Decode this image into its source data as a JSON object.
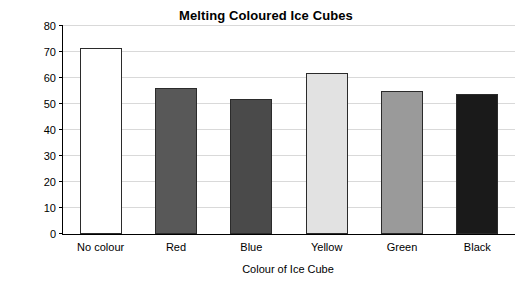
{
  "chart_data": {
    "type": "bar",
    "title": "Melting Coloured Ice Cubes",
    "xlabel": "Colour of Ice Cube",
    "ylabel": "Time to melt (minutes)",
    "categories": [
      "No colour",
      "Red",
      "Blue",
      "Yellow",
      "Green",
      "Black"
    ],
    "values": [
      71.5,
      56,
      52,
      62,
      55,
      54
    ],
    "bar_colors": [
      "#ffffff",
      "#585858",
      "#4a4a4a",
      "#e2e2e2",
      "#9a9a9a",
      "#1a1a1a"
    ],
    "bar_border_color": "#2b2b2b",
    "ylim": [
      0,
      80
    ],
    "yticks": [
      0,
      10,
      20,
      30,
      40,
      50,
      60,
      70,
      80
    ],
    "ytick_labels": [
      "0",
      "10",
      "20",
      "30",
      "40",
      "50",
      "60",
      "70",
      "80"
    ],
    "grid": true,
    "grid_color": "#d9d9d9",
    "legend": "none"
  }
}
